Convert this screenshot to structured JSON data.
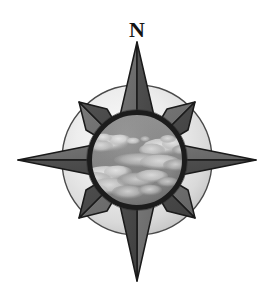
{
  "figure": {
    "kind": "compass-rose-illustration",
    "background_color": "#ffffff"
  },
  "labels": {
    "north": "N"
  },
  "colors": {
    "background": "#ffffff",
    "outline": "#1a1a1a",
    "star_light_face": "#6f6f6f",
    "star_dark_face": "#4a4a4a",
    "halo_center": "#f2f2f2",
    "halo_edge": "#c4c4c4",
    "halo_outline": "#3d3d3d",
    "ring": "#1c1c1c",
    "sky": "#8c8c8c",
    "cloud_light": "#d8d8d8",
    "cloud_mid": "#b4b4b4",
    "cloud_shadow": "#707070"
  },
  "geometry": {
    "center_x": 137,
    "center_y": 160,
    "halo_radius": 75,
    "inner_circle_radius": 49,
    "ring_thickness": 5,
    "cardinal_point_length": 119,
    "diagonal_point_length": 82,
    "point_count": 8
  },
  "parts": [
    {
      "name": "north-point",
      "direction": "N",
      "length": 119
    },
    {
      "name": "east-point",
      "direction": "E",
      "length": 119
    },
    {
      "name": "south-point",
      "direction": "S",
      "length": 119
    },
    {
      "name": "west-point",
      "direction": "W",
      "length": 119
    },
    {
      "name": "northeast-point",
      "direction": "NE",
      "length": 82
    },
    {
      "name": "southeast-point",
      "direction": "SE",
      "length": 82
    },
    {
      "name": "southwest-point",
      "direction": "SW",
      "length": 82
    },
    {
      "name": "northwest-point",
      "direction": "NW",
      "length": 82
    }
  ],
  "center_image": {
    "subject": "clouds-in-sky",
    "rendering": "grayscale-photograph"
  }
}
